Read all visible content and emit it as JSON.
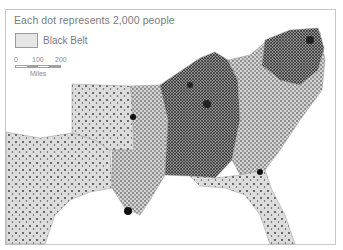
{
  "map": {
    "title": "Each dot represents 2,000 people",
    "legend": {
      "swatch_label": "Black Belt",
      "swatch_color": "#e6e6e6"
    },
    "scale": {
      "ticks": [
        "0",
        "100",
        "200"
      ],
      "unit": "Miles"
    },
    "colors": {
      "land": "#dcdcdc",
      "dot": "#2a2a2a",
      "border": "#9a9a9a",
      "frame": "#c8c8c8"
    }
  }
}
